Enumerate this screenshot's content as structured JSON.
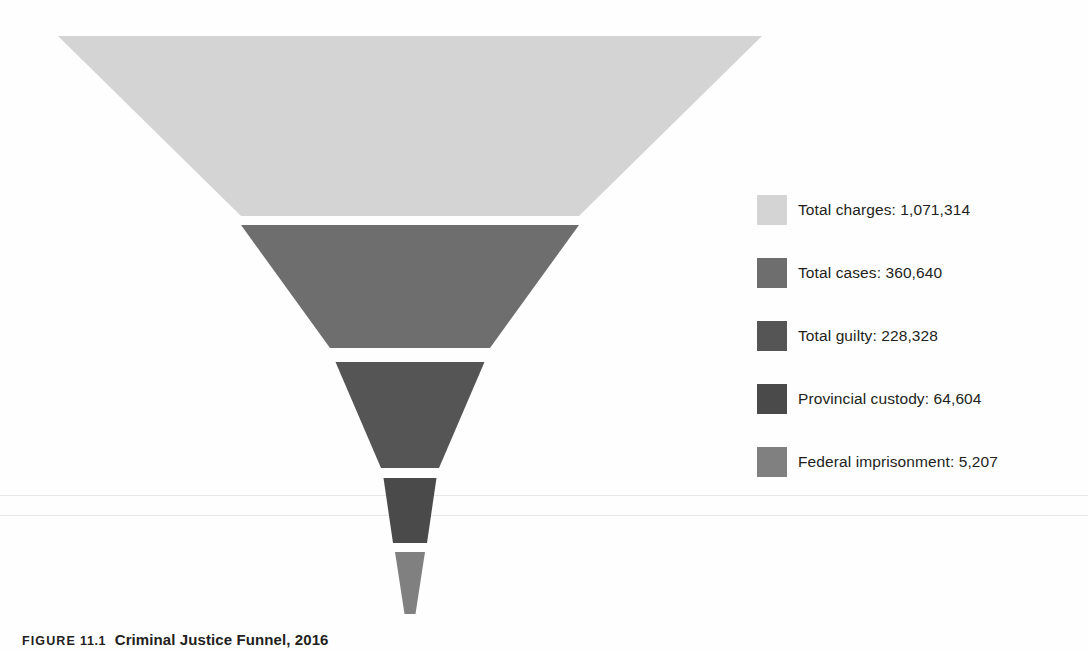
{
  "chart_data": {
    "type": "funnel",
    "title": "Criminal Justice Funnel, 2016",
    "xlabel": "",
    "ylabel": "",
    "grid": false,
    "legend_position": "right",
    "categories": [
      "Total charges",
      "Total cases",
      "Total guilty",
      "Provincial custody",
      "Federal imprisonment"
    ],
    "values": [
      1071314,
      360640,
      228328,
      64604,
      5207
    ],
    "value_labels": [
      "1,071,314",
      "360,640",
      "228,328",
      "64,604",
      "5,207"
    ],
    "colors": [
      "#d4d4d4",
      "#6e6e6e",
      "#555555",
      "#4a4a4a",
      "#808080"
    ],
    "stages": [
      {
        "label": "Total charges",
        "value": 1071314,
        "value_label": "1,071,314",
        "legend_text": "Total charges: 1,071,314",
        "color": "#d4d4d4",
        "top_width": 704,
        "bottom_width": 338,
        "top_y": 36,
        "bottom_y": 216
      },
      {
        "label": "Total cases",
        "value": 360640,
        "value_label": "360,640",
        "legend_text": "Total cases: 360,640",
        "color": "#6e6e6e",
        "top_width": 338,
        "bottom_width": 160,
        "top_y": 225,
        "bottom_y": 348
      },
      {
        "label": "Total guilty",
        "value": 228328,
        "value_label": "228,328",
        "legend_text": "Total guilty: 228,328",
        "color": "#555555",
        "top_width": 149,
        "bottom_width": 58,
        "top_y": 362,
        "bottom_y": 468
      },
      {
        "label": "Provincial custody",
        "value": 64604,
        "value_label": "64,604",
        "legend_text": "Provincial custody: 64,604",
        "color": "#4a4a4a",
        "top_width": 53,
        "bottom_width": 34,
        "top_y": 478,
        "bottom_y": 543
      },
      {
        "label": "Federal imprisonment",
        "value": 5207,
        "value_label": "5,207",
        "legend_text": "Federal imprisonment: 5,207",
        "color": "#808080",
        "top_width": 30,
        "bottom_width": 11,
        "top_y": 552,
        "bottom_y": 614
      }
    ]
  },
  "legend": {
    "items": [
      {
        "text": "Total charges: 1,071,314",
        "color": "#d4d4d4"
      },
      {
        "text": "Total cases: 360,640",
        "color": "#6e6e6e"
      },
      {
        "text": "Total guilty: 228,328",
        "color": "#555555"
      },
      {
        "text": "Provincial custody: 64,604",
        "color": "#4a4a4a"
      },
      {
        "text": "Federal imprisonment: 5,207",
        "color": "#808080"
      }
    ]
  },
  "caption": {
    "figure_word": "FIGURE",
    "figure_number": "11.1",
    "title": "Criminal Justice Funnel, 2016"
  }
}
